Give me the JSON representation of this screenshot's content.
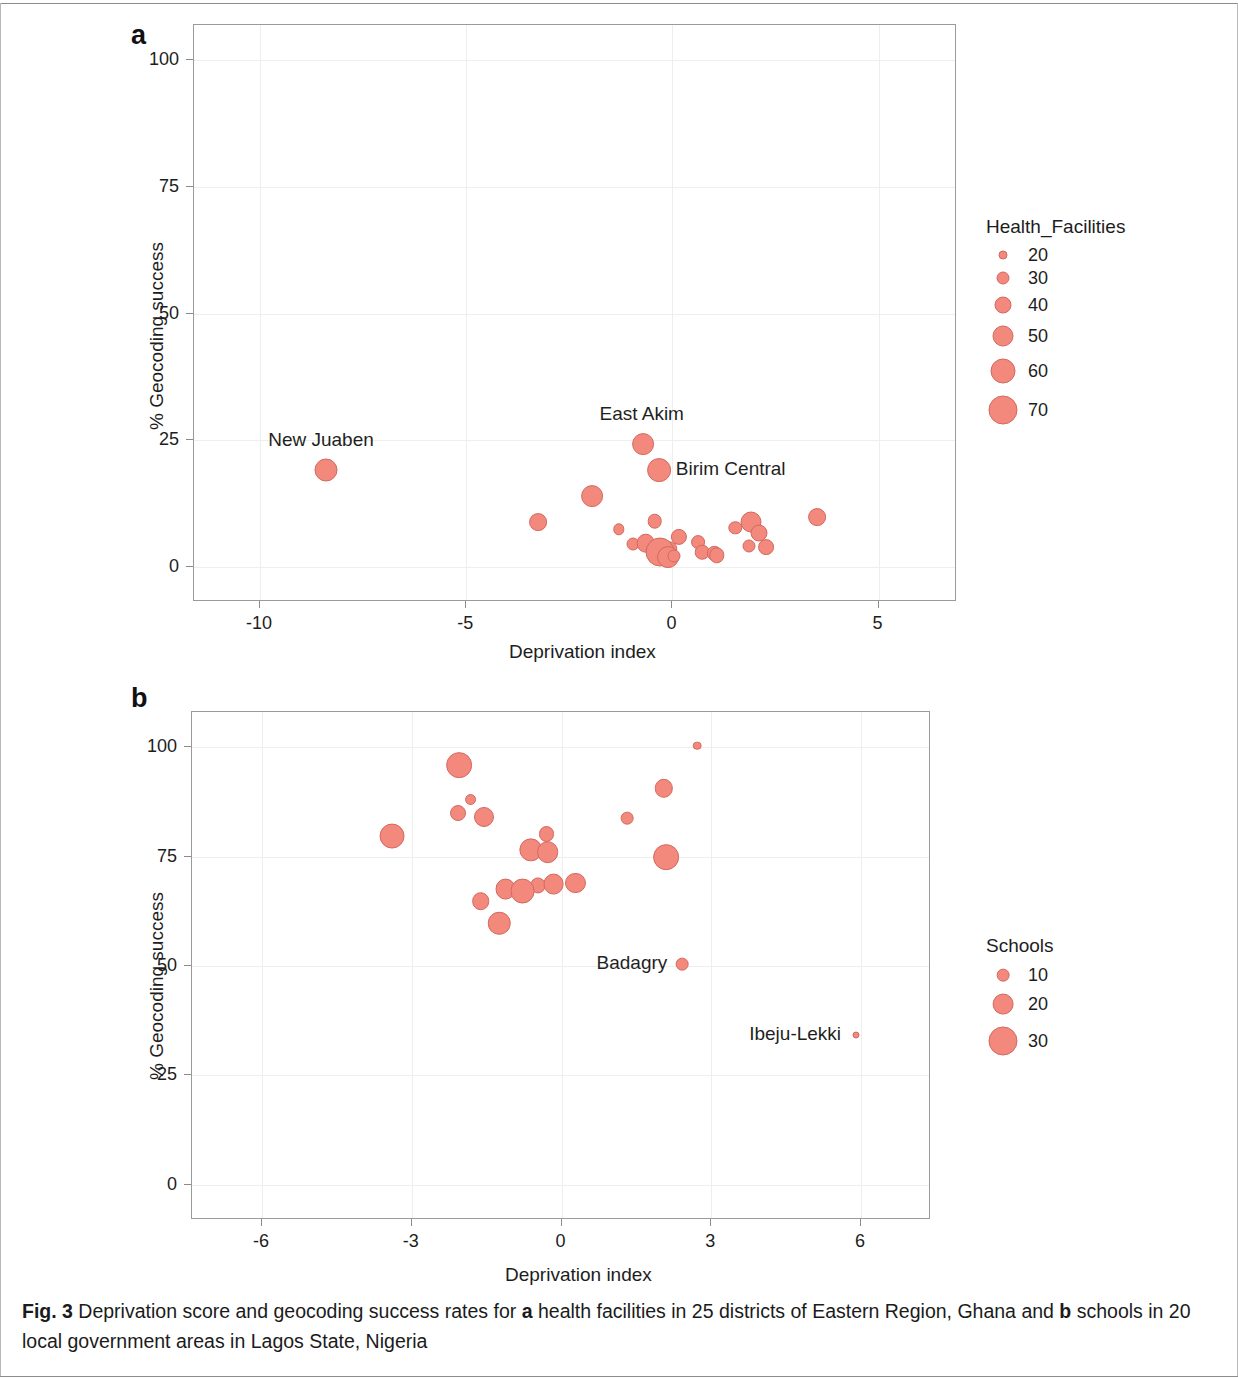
{
  "figure": {
    "caption_prefix": "Fig. 3",
    "caption_part1": "Deprivation score and geocoding success rates for",
    "caption_bold_a": "a",
    "caption_part2": "health facilities in 25 districts of Eastern Region, Ghana and",
    "caption_bold_b": "b",
    "caption_part3": "schools in 20 local government areas in Lagos State, Nigeria",
    "marker_color": "#f2897c",
    "marker_edge_color": "#d4685f"
  },
  "panel_a": {
    "letter": "a",
    "legend_title": "Health_Facilities",
    "legend_entries": [
      {
        "label": "20",
        "size": 20
      },
      {
        "label": "30",
        "size": 30
      },
      {
        "label": "40",
        "size": 40
      },
      {
        "label": "50",
        "size": 50
      },
      {
        "label": "60",
        "size": 60
      },
      {
        "label": "70",
        "size": 70
      }
    ]
  },
  "panel_b": {
    "letter": "b",
    "legend_title": "Schools",
    "legend_entries": [
      {
        "label": "10",
        "size": 10
      },
      {
        "label": "20",
        "size": 20
      },
      {
        "label": "30",
        "size": 30
      }
    ]
  },
  "chart_data": [
    {
      "type": "scatter",
      "panel": "a",
      "title": "",
      "xlabel": "Deprivation index",
      "ylabel": "% Geocoding success",
      "xlim": [
        -11.6,
        6.9
      ],
      "ylim": [
        -7,
        107
      ],
      "xticks": [
        -10,
        -5,
        0,
        5
      ],
      "xticklabels": [
        "-10",
        "-5",
        "0",
        "5"
      ],
      "yticks": [
        0,
        25,
        50,
        75,
        100
      ],
      "yticklabels": [
        "0",
        "25",
        "50",
        "75",
        "100"
      ],
      "grid": true,
      "size_legend": {
        "name": "Health_Facilities",
        "values": [
          20,
          30,
          40,
          50,
          60,
          70
        ]
      },
      "legend_position": "right",
      "annotations": [
        {
          "text": "New Juaben",
          "x": -8.4,
          "y": 19.0,
          "placement": "above-left"
        },
        {
          "text": "East Akim",
          "x": -0.72,
          "y": 24.2,
          "placement": "above"
        },
        {
          "text": "Birim Central",
          "x": -0.33,
          "y": 19.0,
          "placement": "right"
        }
      ],
      "points": [
        {
          "name": "New Juaben",
          "x": -8.4,
          "y": 19.0,
          "size": 55
        },
        {
          "name": "East Akim",
          "x": -0.72,
          "y": 24.2,
          "size": 52
        },
        {
          "name": "Birim Central",
          "x": -0.33,
          "y": 19.0,
          "size": 57
        },
        {
          "name": "",
          "x": -1.95,
          "y": 14.0,
          "size": 52
        },
        {
          "name": "",
          "x": -3.25,
          "y": 8.8,
          "size": 42
        },
        {
          "name": "",
          "x": -1.3,
          "y": 7.4,
          "size": 26
        },
        {
          "name": "",
          "x": -0.43,
          "y": 9.0,
          "size": 34
        },
        {
          "name": "",
          "x": 3.5,
          "y": 9.8,
          "size": 42
        },
        {
          "name": "",
          "x": 1.9,
          "y": 8.8,
          "size": 50
        },
        {
          "name": "",
          "x": 1.52,
          "y": 7.6,
          "size": 31
        },
        {
          "name": "",
          "x": 2.1,
          "y": 6.6,
          "size": 40
        },
        {
          "name": "",
          "x": 0.15,
          "y": 5.8,
          "size": 38
        },
        {
          "name": "",
          "x": -0.95,
          "y": 4.5,
          "size": 30
        },
        {
          "name": "",
          "x": -0.65,
          "y": 4.6,
          "size": 44
        },
        {
          "name": "",
          "x": 0.62,
          "y": 4.8,
          "size": 32
        },
        {
          "name": "",
          "x": 1.85,
          "y": 4.0,
          "size": 30
        },
        {
          "name": "",
          "x": 2.28,
          "y": 3.9,
          "size": 37
        },
        {
          "name": "",
          "x": -0.07,
          "y": 3.5,
          "size": 36
        },
        {
          "name": "",
          "x": -0.18,
          "y": 3.0,
          "size": 45
        },
        {
          "name": "",
          "x": -0.3,
          "y": 2.8,
          "size": 70
        },
        {
          "name": "",
          "x": -0.1,
          "y": 1.8,
          "size": 52
        },
        {
          "name": "",
          "x": 0.72,
          "y": 2.8,
          "size": 34
        },
        {
          "name": "",
          "x": 1.02,
          "y": 2.6,
          "size": 33
        },
        {
          "name": "",
          "x": 1.08,
          "y": 2.2,
          "size": 36
        },
        {
          "name": "",
          "x": 0.05,
          "y": 2.0,
          "size": 30
        }
      ]
    },
    {
      "type": "scatter",
      "panel": "b",
      "title": "",
      "xlabel": "Deprivation index",
      "ylabel": "% Geocoding success",
      "xlim": [
        -7.4,
        7.4
      ],
      "ylim": [
        -8,
        108
      ],
      "xticks": [
        -6,
        -3,
        0,
        3,
        6
      ],
      "xticklabels": [
        "-6",
        "-3",
        "0",
        "3",
        "6"
      ],
      "yticks": [
        0,
        25,
        50,
        75,
        100
      ],
      "yticklabels": [
        "0",
        "25",
        "50",
        "75",
        "100"
      ],
      "grid": true,
      "size_legend": {
        "name": "Schools",
        "values": [
          10,
          20,
          30
        ]
      },
      "legend_position": "right",
      "annotations": [
        {
          "text": "Badagry",
          "x": 2.42,
          "y": 50.5,
          "placement": "left"
        },
        {
          "text": "Ibeju-Lekki",
          "x": 5.9,
          "y": 34.2,
          "placement": "left"
        }
      ],
      "points": [
        {
          "name": "",
          "x": 2.72,
          "y": 100.3,
          "size": 5
        },
        {
          "name": "",
          "x": -2.05,
          "y": 95.8,
          "size": 26
        },
        {
          "name": "",
          "x": 2.05,
          "y": 90.6,
          "size": 17
        },
        {
          "name": "",
          "x": -1.82,
          "y": 88.0,
          "size": 9
        },
        {
          "name": "",
          "x": -2.08,
          "y": 85.0,
          "size": 14
        },
        {
          "name": "",
          "x": -1.55,
          "y": 84.0,
          "size": 19
        },
        {
          "name": "",
          "x": 1.32,
          "y": 83.8,
          "size": 10
        },
        {
          "name": "",
          "x": -3.4,
          "y": 79.6,
          "size": 25
        },
        {
          "name": "",
          "x": -0.3,
          "y": 80.2,
          "size": 14
        },
        {
          "name": "",
          "x": -0.62,
          "y": 76.6,
          "size": 23
        },
        {
          "name": "",
          "x": -0.28,
          "y": 76.0,
          "size": 21
        },
        {
          "name": "",
          "x": 2.1,
          "y": 74.8,
          "size": 26
        },
        {
          "name": "",
          "x": -0.48,
          "y": 68.4,
          "size": 13
        },
        {
          "name": "",
          "x": -0.16,
          "y": 68.7,
          "size": 20
        },
        {
          "name": "",
          "x": -1.12,
          "y": 67.6,
          "size": 20
        },
        {
          "name": "",
          "x": -0.78,
          "y": 67.2,
          "size": 25
        },
        {
          "name": "",
          "x": 0.28,
          "y": 69.0,
          "size": 19
        },
        {
          "name": "",
          "x": -1.62,
          "y": 64.8,
          "size": 16
        },
        {
          "name": "",
          "x": -1.25,
          "y": 59.8,
          "size": 22
        },
        {
          "name": "Badagry",
          "x": 2.42,
          "y": 50.5,
          "size": 10
        },
        {
          "name": "Ibeju-Lekki",
          "x": 5.9,
          "y": 34.2,
          "size": 3
        }
      ]
    }
  ]
}
